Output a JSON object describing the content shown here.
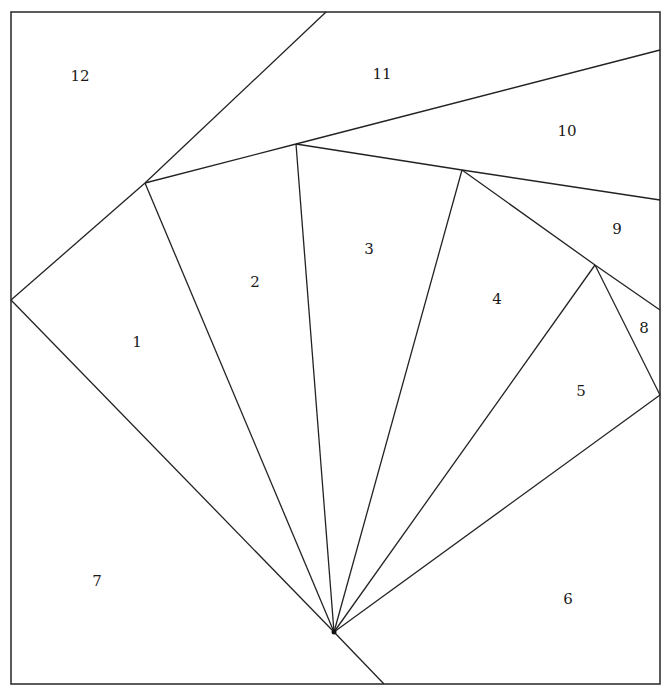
{
  "diagram": {
    "type": "paper-piecing-pattern",
    "frame": {
      "x1": 11,
      "y1": 12,
      "x2": 660,
      "y2": 684
    },
    "hub": {
      "x": 334,
      "y": 632
    },
    "vertices": {
      "left_mid": [
        11,
        300
      ],
      "A": [
        145,
        183
      ],
      "B": [
        296,
        144
      ],
      "C": [
        462,
        170
      ],
      "D": [
        595,
        265
      ],
      "E": [
        660,
        395
      ],
      "top": [
        326,
        12
      ],
      "right_10_11": [
        660,
        50
      ],
      "right_9_10": [
        660,
        200
      ],
      "right_8_9": [
        660,
        310
      ],
      "bottom": [
        384,
        684
      ]
    },
    "edges": [
      {
        "from": [
          11,
          300
        ],
        "to": [
          334,
          632
        ]
      },
      {
        "from": [
          334,
          632
        ],
        "to": [
          384,
          684
        ]
      },
      {
        "from": [
          11,
          300
        ],
        "to": [
          145,
          183
        ]
      },
      {
        "from": [
          145,
          183
        ],
        "to": [
          326,
          12
        ]
      },
      {
        "from": [
          145,
          183
        ],
        "to": [
          296,
          144
        ]
      },
      {
        "from": [
          296,
          144
        ],
        "to": [
          660,
          50
        ]
      },
      {
        "from": [
          296,
          144
        ],
        "to": [
          462,
          170
        ]
      },
      {
        "from": [
          462,
          170
        ],
        "to": [
          660,
          200
        ]
      },
      {
        "from": [
          462,
          170
        ],
        "to": [
          595,
          265
        ]
      },
      {
        "from": [
          595,
          265
        ],
        "to": [
          660,
          310
        ]
      },
      {
        "from": [
          595,
          265
        ],
        "to": [
          660,
          395
        ]
      },
      {
        "from": [
          145,
          183
        ],
        "to": [
          334,
          632
        ]
      },
      {
        "from": [
          296,
          144
        ],
        "to": [
          334,
          632
        ]
      },
      {
        "from": [
          462,
          170
        ],
        "to": [
          334,
          632
        ]
      },
      {
        "from": [
          595,
          265
        ],
        "to": [
          334,
          632
        ]
      },
      {
        "from": [
          660,
          395
        ],
        "to": [
          334,
          632
        ]
      }
    ],
    "labels": [
      {
        "id": "1",
        "text": "1",
        "x": 137,
        "y": 343
      },
      {
        "id": "2",
        "text": "2",
        "x": 255,
        "y": 283
      },
      {
        "id": "3",
        "text": "3",
        "x": 369,
        "y": 250
      },
      {
        "id": "4",
        "text": "4",
        "x": 497,
        "y": 300
      },
      {
        "id": "5",
        "text": "5",
        "x": 581,
        "y": 392
      },
      {
        "id": "6",
        "text": "6",
        "x": 568,
        "y": 600
      },
      {
        "id": "7",
        "text": "7",
        "x": 97,
        "y": 582
      },
      {
        "id": "8",
        "text": "8",
        "x": 644,
        "y": 329
      },
      {
        "id": "9",
        "text": "9",
        "x": 617,
        "y": 230
      },
      {
        "id": "10",
        "text": "10",
        "x": 567,
        "y": 132
      },
      {
        "id": "11",
        "text": "11",
        "x": 382,
        "y": 75
      },
      {
        "id": "12",
        "text": "12",
        "x": 80,
        "y": 77
      }
    ]
  },
  "colors": {
    "line": "#222222",
    "background": "#ffffff",
    "text": "#1a1a1a"
  }
}
